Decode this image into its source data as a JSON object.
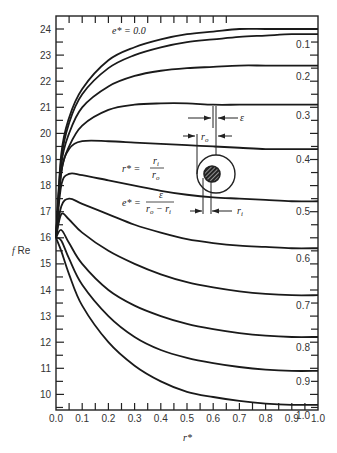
{
  "chart_data": {
    "type": "line",
    "title": "",
    "xlabel": "r*",
    "ylabel": "f Re",
    "xlim": [
      0.0,
      1.0
    ],
    "ylim": [
      9.4,
      24.5
    ],
    "grid": false,
    "x_ticks": [
      "0.0",
      "0.1",
      "0.2",
      "0.3",
      "0.4",
      "0.5",
      "0.6",
      "0.7",
      "0.8",
      "0.9",
      "1.0"
    ],
    "y_ticks": [
      "10",
      "11",
      "12",
      "13",
      "14",
      "15",
      "16",
      "17",
      "18",
      "19",
      "20",
      "21",
      "22",
      "23",
      "24"
    ],
    "legend_position": "inline labels at right end of curves",
    "x": [
      0.0,
      0.02,
      0.05,
      0.1,
      0.2,
      0.3,
      0.4,
      0.5,
      0.6,
      0.7,
      0.8,
      0.9,
      1.0
    ],
    "series": [
      {
        "name": "e* = 0.0",
        "values": [
          16.0,
          19.2,
          20.6,
          21.7,
          22.8,
          23.3,
          23.6,
          23.8,
          23.9,
          24.0,
          24.0,
          24.0,
          24.0
        ]
      },
      {
        "name": "0.1",
        "values": [
          16.0,
          19.0,
          20.4,
          21.5,
          22.5,
          23.0,
          23.3,
          23.5,
          23.6,
          23.7,
          23.75,
          23.8,
          23.8
        ]
      },
      {
        "name": "0.2",
        "values": [
          16.0,
          18.8,
          20.0,
          21.0,
          21.8,
          22.2,
          22.4,
          22.5,
          22.55,
          22.6,
          22.6,
          22.6,
          22.6
        ]
      },
      {
        "name": "0.3",
        "values": [
          16.0,
          18.5,
          19.5,
          20.3,
          20.9,
          21.1,
          21.15,
          21.15,
          21.1,
          21.1,
          21.1,
          21.1,
          21.1
        ]
      },
      {
        "name": "0.4",
        "values": [
          16.0,
          18.5,
          19.4,
          19.7,
          19.7,
          19.65,
          19.6,
          19.55,
          19.5,
          19.45,
          19.4,
          19.4,
          19.4
        ]
      },
      {
        "name": "0.5",
        "values": [
          16.0,
          18.0,
          18.45,
          18.4,
          18.2,
          18.0,
          17.8,
          17.65,
          17.55,
          17.5,
          17.45,
          17.4,
          17.4
        ]
      },
      {
        "name": "0.6",
        "values": [
          16.0,
          17.2,
          17.5,
          17.3,
          16.9,
          16.5,
          16.2,
          15.95,
          15.8,
          15.7,
          15.65,
          15.6,
          15.6
        ]
      },
      {
        "name": "0.7",
        "values": [
          16.0,
          16.9,
          16.7,
          16.2,
          15.5,
          15.0,
          14.6,
          14.3,
          14.1,
          13.95,
          13.85,
          13.8,
          13.8
        ]
      },
      {
        "name": "0.8",
        "values": [
          16.0,
          16.3,
          15.8,
          15.0,
          14.0,
          13.4,
          13.0,
          12.7,
          12.5,
          12.35,
          12.25,
          12.2,
          12.2
        ]
      },
      {
        "name": "0.9",
        "values": [
          16.0,
          15.9,
          15.2,
          14.2,
          13.0,
          12.2,
          11.7,
          11.4,
          11.2,
          11.05,
          10.95,
          10.9,
          10.9
        ]
      },
      {
        "name": "1.0",
        "values": [
          16.0,
          15.5,
          14.6,
          13.4,
          12.0,
          11.1,
          10.5,
          10.1,
          9.9,
          9.75,
          9.65,
          9.6,
          9.6
        ]
      }
    ],
    "annotations": [
      "e* = 0.0",
      "r* = r_i / r_o",
      "e* = ε / (r_o − r_i)",
      "inset: eccentric annulus diagram with r_o, r_i, ε dimensions"
    ]
  },
  "labels": {
    "ylabel": "f Re",
    "xlabel": "r*",
    "top_curve_label": "e* = 0.0",
    "curve_labels": [
      "0.1",
      "0.2",
      "0.3",
      "0.4",
      "0.5",
      "0.6",
      "0.7",
      "0.8",
      "0.9",
      "1.0"
    ],
    "eq_r_lhs": "r* =",
    "eq_r_num": "r",
    "eq_r_num_sub": "i",
    "eq_r_den": "r",
    "eq_r_den_sub": "o",
    "eq_e_lhs": "e* =",
    "eq_e_num": "ε",
    "eq_e_den": "r",
    "eq_e_den_sub1": "o",
    "eq_e_den_mid": " − r",
    "eq_e_den_sub2": "i",
    "dim_ro": "r",
    "dim_ro_sub": "o",
    "dim_ri": "r",
    "dim_ri_sub": "i",
    "dim_eps": "ε"
  }
}
